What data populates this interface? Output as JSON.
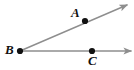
{
  "figure": {
    "kind": "geometry-angle-diagram",
    "width": 134,
    "height": 70,
    "background_color": "#ffffff",
    "line_color": "#8e8e8e",
    "point_color": "#111111",
    "label_color": "#111111",
    "line_width": 1.4,
    "point_radius": 3.1
  },
  "points": [
    {
      "id": "A",
      "label": "A",
      "x": 85,
      "y": 21,
      "label_x": 71,
      "label_y": 6
    },
    {
      "id": "B",
      "label": "B",
      "x": 20,
      "y": 51,
      "label_x": 5,
      "label_y": 43
    },
    {
      "id": "C",
      "label": "C",
      "x": 92,
      "y": 51,
      "label_x": 88,
      "label_y": 54
    }
  ],
  "rays": [
    {
      "id": "ray-BA",
      "from": "B",
      "through": "A",
      "start_x": 20,
      "start_y": 51,
      "end_x": 127,
      "end_y": 5,
      "arrowhead": true
    },
    {
      "id": "ray-BC",
      "from": "B",
      "through": "C",
      "start_x": 20,
      "start_y": 51,
      "end_x": 131,
      "end_y": 51,
      "arrowhead": true
    }
  ]
}
